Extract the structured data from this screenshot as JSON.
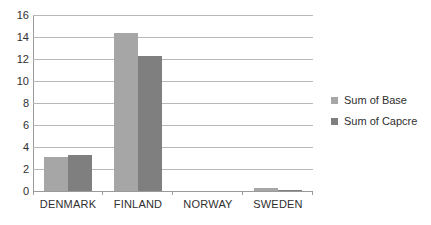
{
  "chart_data": {
    "type": "bar",
    "title": "",
    "subtitle": "",
    "xlabel": "",
    "ylabel": "",
    "categories": [
      "DENMARK",
      "FINLAND",
      "NORWAY",
      "SWEDEN"
    ],
    "series": [
      {
        "name": "Sum of Base",
        "color": "#a6a6a6",
        "values": [
          3.1,
          14.4,
          0,
          0.3
        ]
      },
      {
        "name": "Sum of Capcre",
        "color": "#7f7f7f",
        "values": [
          3.3,
          12.3,
          0,
          0.1
        ]
      }
    ],
    "ylim": [
      0,
      16
    ],
    "ytick_step": 2,
    "yticks": [
      16,
      14,
      12,
      10,
      8,
      6,
      4,
      2,
      0
    ],
    "ytick_labels": [
      "16",
      "14",
      "12",
      "10",
      "8",
      "6",
      "4",
      "2",
      "0"
    ],
    "grid": true,
    "grid_axis": "y",
    "legend_position": "right",
    "background_color": "#ffffff",
    "gridline_color": "#b8b8b8",
    "axis_color": "#9a9a9a",
    "text_color": "#2f2f2f"
  }
}
